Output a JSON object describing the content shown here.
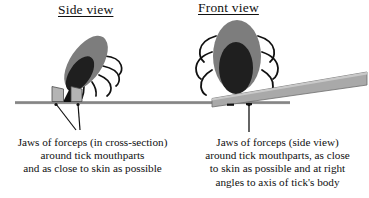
{
  "figure": {
    "title_bar": null,
    "background_color": "#ffffff",
    "ink_color": "#101010",
    "tick_body_color": "#808080",
    "tick_inner_color": "#262626",
    "forceps_color": "#a6a6a6",
    "skin_line_color": "#8c8c8c"
  },
  "panels": [
    {
      "id": "side",
      "title": "Side view",
      "caption_lines": [
        "Jaws of forceps (in cross-section)",
        "around tick mouthparts",
        "and as close to skin as possible"
      ],
      "elements": {
        "tick": "tick-side-view",
        "forceps": "forceps-jaws-cross-section",
        "skin": "skin-surface-line",
        "pointer": "caption-pointer-v-lines"
      }
    },
    {
      "id": "front",
      "title": "Front view",
      "caption_lines": [
        "Jaws of forceps (side view)",
        "around tick mouthparts, as close",
        "to skin as possible and at right",
        "angles to axis of tick's body"
      ],
      "elements": {
        "tick": "tick-front-view",
        "forceps": "forceps-side-view-wedge",
        "skin": "skin-surface-line",
        "pointer": "caption-pointer-line"
      }
    }
  ]
}
